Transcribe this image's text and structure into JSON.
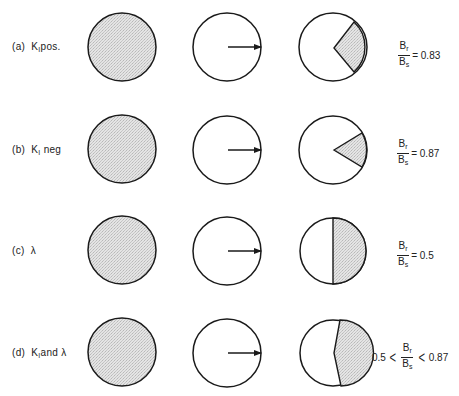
{
  "figure": {
    "shade_color": "#dcdcdc",
    "stroke_color": "#1a1a1a",
    "rows": [
      {
        "id": "a",
        "label_prefix": "(a)",
        "label_k": "K",
        "label_sub": "I",
        "label_suffix": "pos.",
        "ratio_num": "B",
        "ratio_num_sub": "r",
        "ratio_den": "B",
        "ratio_den_sub": "s",
        "equals": "= 0.83",
        "lower_bound": "",
        "upper_bound": ""
      },
      {
        "id": "b",
        "label_prefix": "(b)",
        "label_k": "K",
        "label_sub": "I",
        "label_suffix": "neg",
        "ratio_num": "B",
        "ratio_num_sub": "r",
        "ratio_den": "B",
        "ratio_den_sub": "s",
        "equals": "= 0.87",
        "lower_bound": "",
        "upper_bound": ""
      },
      {
        "id": "c",
        "label_prefix": "(c)",
        "label_k": "λ",
        "label_sub": "",
        "label_suffix": "",
        "ratio_num": "B",
        "ratio_num_sub": "r",
        "ratio_den": "B",
        "ratio_den_sub": "s",
        "equals": "=  0.5",
        "lower_bound": "",
        "upper_bound": ""
      },
      {
        "id": "d",
        "label_prefix": "(d)",
        "label_k": "K",
        "label_sub": "I",
        "label_suffix": "and λ",
        "ratio_num": "B",
        "ratio_num_sub": "r",
        "ratio_den": "B",
        "ratio_den_sub": "s",
        "equals": "",
        "lower_bound": "0.5",
        "upper_bound": "0.87",
        "lt_symbol": "<"
      }
    ]
  }
}
